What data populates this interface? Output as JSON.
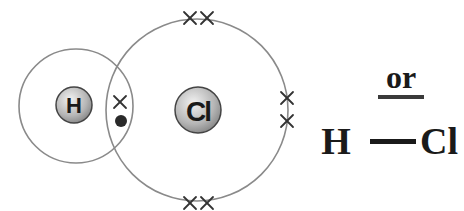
{
  "diagram": {
    "type": "dot-and-cross",
    "molecule": "HCl",
    "atoms": [
      {
        "symbol": "H",
        "shell_electrons": "1 dot (shared)"
      },
      {
        "symbol": "Cl",
        "shell_electrons": "7 crosses (1 shared + 3 lone pairs)"
      }
    ],
    "shared_pair": {
      "cross": "×",
      "dot": "•"
    },
    "lone_pair_symbol": "××",
    "connector_text": "or",
    "structural_formula": {
      "left": "H",
      "bond": "—",
      "right": "Cl"
    }
  },
  "colors": {
    "shell": "#8a8a8a",
    "text": "#1a1a1a",
    "nucleus_fill": "#c8c8c8"
  }
}
